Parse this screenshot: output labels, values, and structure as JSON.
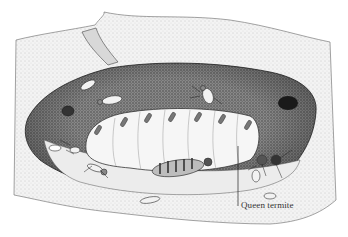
{
  "illustration": {
    "subject": "termite queen chamber",
    "style": "pen-and-ink stipple drawing",
    "label": "Queen termite",
    "colors": {
      "background": "#ffffff",
      "ink": "#1a1a1a",
      "chamber_wall": "#6e6e6e",
      "chamber_dark": "#2a2a2a",
      "queen_body": "#f4f4f4"
    }
  }
}
